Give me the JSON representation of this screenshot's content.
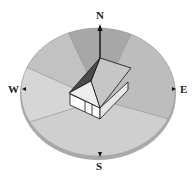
{
  "diagram": {
    "directions": {
      "north": "N",
      "east": "E",
      "south": "S",
      "west": "W"
    },
    "colors": {
      "north_sector": "#a7a7a7",
      "northeast_sector": "#bdbdbd",
      "northwest_sector": "#c2c2c2",
      "west_sector": "#d6d6d6",
      "south_sector": "#cfcfcf",
      "rim": "#a9a9a9",
      "roof_dark": "#4a4a4a",
      "roof_light": "#c6c6c6",
      "gable": "#eeeeee",
      "wall": "#ffffff"
    }
  }
}
